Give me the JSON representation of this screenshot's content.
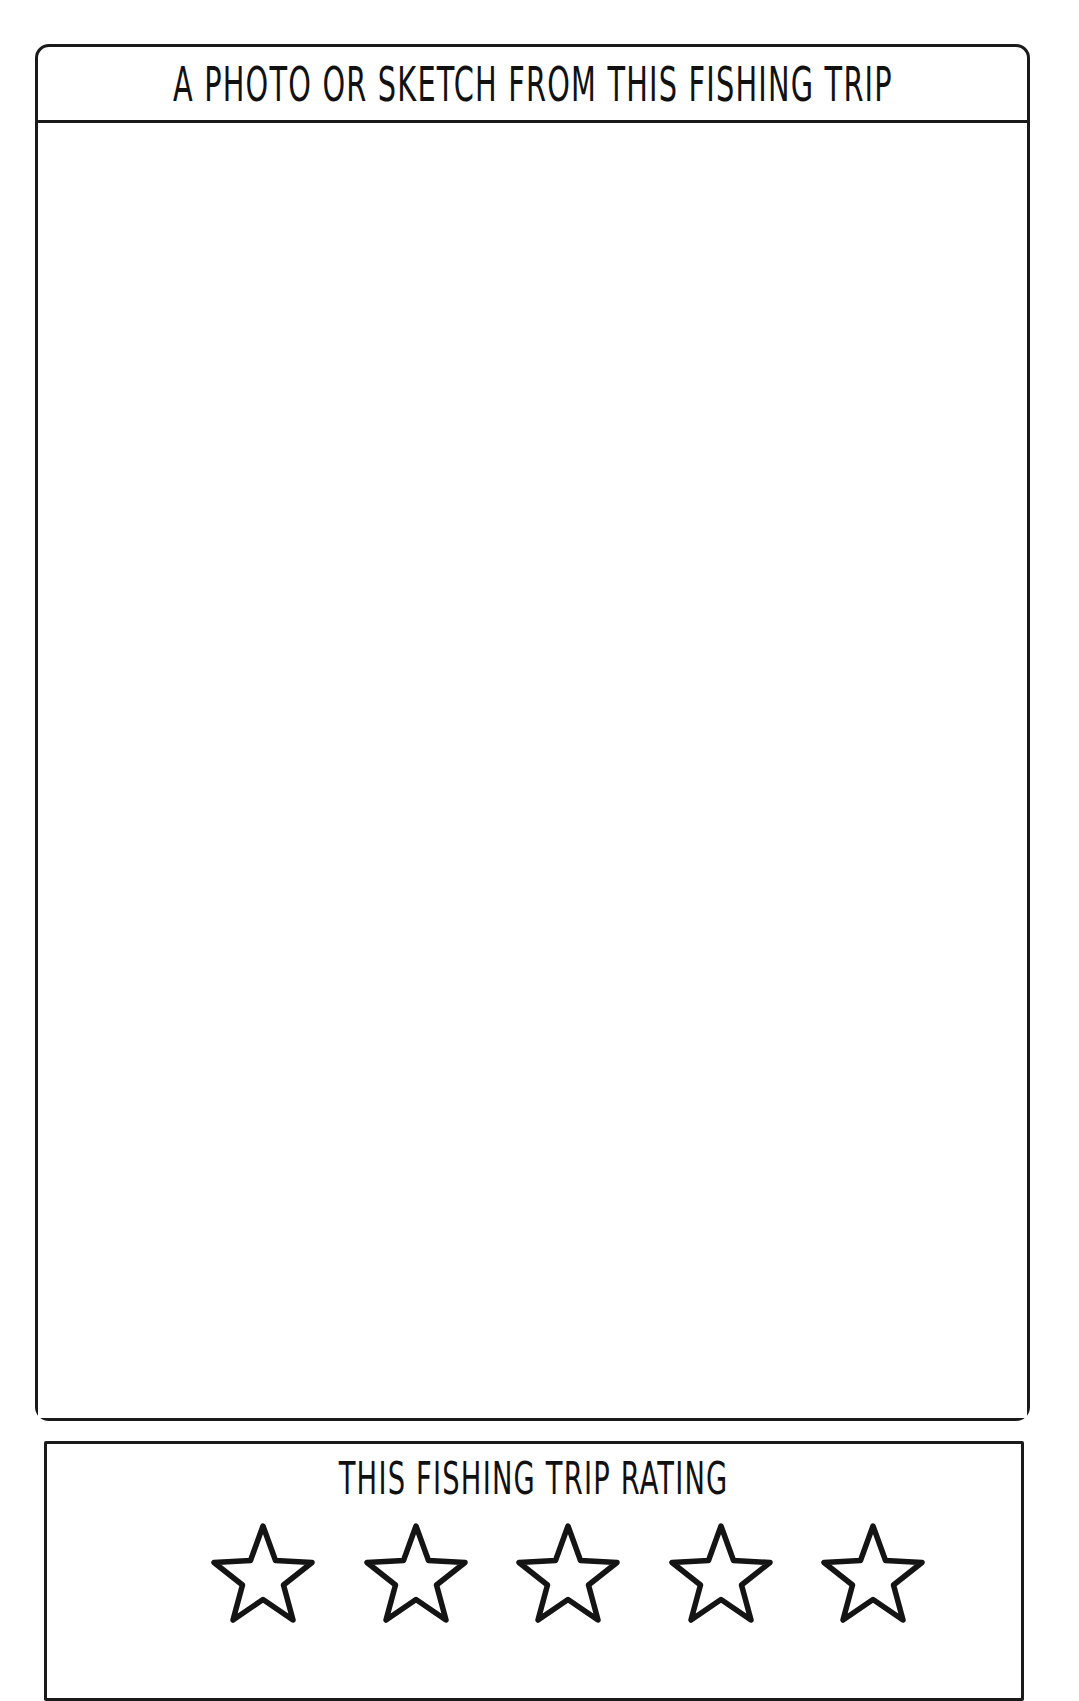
{
  "page": {
    "background_color": "#ffffff",
    "ink_color": "#141414",
    "style": "hand-drawn journal worksheet"
  },
  "photo_panel": {
    "header_title": "A PHOTO OR SKETCH FROM THIS FISHING TRIP",
    "canvas_content": "",
    "border_color": "#1a1a1a"
  },
  "rating_panel": {
    "title": "THIS FISHING TRIP RATING",
    "stars": [
      {
        "index": 1,
        "icon": "star-outline-icon",
        "filled": false
      },
      {
        "index": 2,
        "icon": "star-outline-icon",
        "filled": false
      },
      {
        "index": 3,
        "icon": "star-outline-icon",
        "filled": false
      },
      {
        "index": 4,
        "icon": "star-outline-icon",
        "filled": false
      },
      {
        "index": 5,
        "icon": "star-outline-icon",
        "filled": false
      }
    ],
    "selected_rating": 0,
    "max_rating": 5,
    "border_color": "#1a1a1a"
  }
}
